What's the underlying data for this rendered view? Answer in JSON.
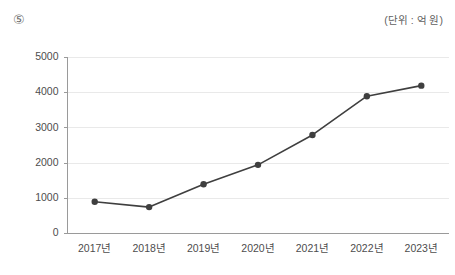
{
  "header": {
    "item_marker": "⑤",
    "unit_note": "(단위 : 억 원)"
  },
  "chart_data": {
    "type": "line",
    "title": "",
    "subtitle": "",
    "xlabel": "",
    "ylabel": "",
    "unit_note": "(단위 : 억 원)",
    "categories": [
      "2017년",
      "2018년",
      "2019년",
      "2020년",
      "2021년",
      "2022년",
      "2023년"
    ],
    "values": [
      900,
      750,
      1400,
      1950,
      2800,
      3900,
      4200
    ],
    "series": [
      {
        "name": "",
        "values": [
          900,
          750,
          1400,
          1950,
          2800,
          3900,
          4200
        ]
      }
    ],
    "ylim": [
      0,
      5000
    ],
    "yticks": [
      0,
      1000,
      2000,
      3000,
      4000,
      5000
    ],
    "ytick_labels": [
      "0",
      "1000",
      "2000",
      "3000",
      "4000",
      "5000"
    ],
    "grid": true,
    "grid_axis": "y",
    "legend": false,
    "legend_position": "none",
    "markers": "circle",
    "line_color": "#3f3f3f",
    "marker_color": "#3f3f3f",
    "grid_color": "#e9e9e9",
    "axis_color": "#9a9a9a"
  },
  "yaxis": {
    "labels": [
      "5000",
      "4000",
      "3000",
      "2000",
      "1000",
      "0"
    ]
  },
  "xaxis": {
    "labels": [
      "2017년",
      "2018년",
      "2019년",
      "2020년",
      "2021년",
      "2022년",
      "2023년"
    ]
  }
}
